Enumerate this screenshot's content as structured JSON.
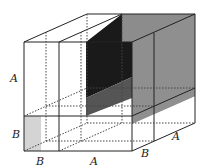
{
  "diagram": {
    "labels": {
      "left_A": "A",
      "left_B": "B",
      "bottom_B": "B",
      "bottom_A": "A",
      "right_B": "B",
      "right_A": "A"
    },
    "colors": {
      "dark_block": "#1a1a1a",
      "gray_block": "#8c8c8c",
      "light_block": "#d4d4d4",
      "line": "#222222"
    }
  }
}
